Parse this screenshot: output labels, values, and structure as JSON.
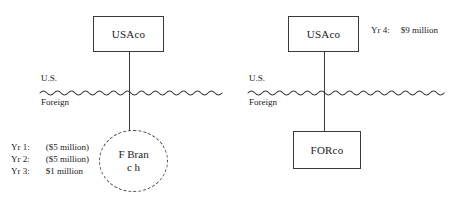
{
  "diagram": {
    "type": "entity-structure-diagram",
    "line_color": "#3a3a3a",
    "background_color": "#ffffff",
    "panels": [
      {
        "id": "left",
        "name": "branch-structure",
        "parent": {
          "label": "USAco",
          "shape": "rectangle"
        },
        "child": {
          "label": "F Branc h",
          "shape": "dashed-circle"
        },
        "border": {
          "above_label": "U.S.",
          "below_label": "Foreign",
          "style": "wavy-line"
        },
        "annotations": [
          {
            "year": "Yr 1:",
            "amount": "($5 million)"
          },
          {
            "year": "Yr 2:",
            "amount": "($5 million)"
          },
          {
            "year": "Yr 3:",
            "amount": "$1 million"
          }
        ]
      },
      {
        "id": "right",
        "name": "subsidiary-structure",
        "parent": {
          "label": "USAco",
          "shape": "rectangle"
        },
        "child": {
          "label": "FORco",
          "shape": "rectangle"
        },
        "border": {
          "above_label": "U.S.",
          "below_label": "Foreign",
          "style": "wavy-line"
        },
        "annotations": [
          {
            "year": "Yr 4:",
            "amount": "$9 million"
          }
        ]
      }
    ]
  }
}
